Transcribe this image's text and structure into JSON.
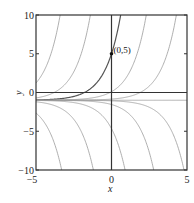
{
  "chart_data": {
    "type": "line",
    "title": "",
    "xlabel": "x",
    "ylabel": "y",
    "xlim": [
      -5,
      5
    ],
    "ylim": [
      -10,
      10
    ],
    "xticks": [
      -5,
      0,
      5
    ],
    "yticks": [
      -10,
      -5,
      0,
      5,
      10
    ],
    "xtick_labels": [
      "-5",
      "0",
      "5"
    ],
    "ytick_labels": [
      "-10",
      "-5",
      "0",
      "5",
      "10"
    ],
    "grid": false,
    "legend": null,
    "family": "y = C·e^x − 1",
    "series": [
      {
        "name": "C=330",
        "C": 330,
        "highlight": false
      },
      {
        "name": "C=44.6",
        "C": 44.6,
        "highlight": false
      },
      {
        "name": "C=6 (through (0,5))",
        "C": 6,
        "highlight": true
      },
      {
        "name": "C=1.1",
        "C": 1.1,
        "highlight": false
      },
      {
        "name": "C=0.15",
        "C": 0.15,
        "highlight": false
      },
      {
        "name": "C=0",
        "C": 0,
        "highlight": false
      },
      {
        "name": "C=-0.074",
        "C": -0.074,
        "highlight": false
      },
      {
        "name": "C=-0.55",
        "C": -0.55,
        "highlight": false
      },
      {
        "name": "C=-3.66",
        "C": -3.66,
        "highlight": false
      },
      {
        "name": "C=-29.9",
        "C": -29.9,
        "highlight": false
      },
      {
        "name": "C=-244",
        "C": -244,
        "highlight": false
      }
    ],
    "annotations": [
      {
        "type": "point",
        "x": 0,
        "y": 5,
        "label": "(0,5)"
      }
    ],
    "colors": {
      "curve": "#9a9a9a",
      "highlight_curve": "#555555",
      "axis": "#333333",
      "frame": "#333333"
    }
  }
}
